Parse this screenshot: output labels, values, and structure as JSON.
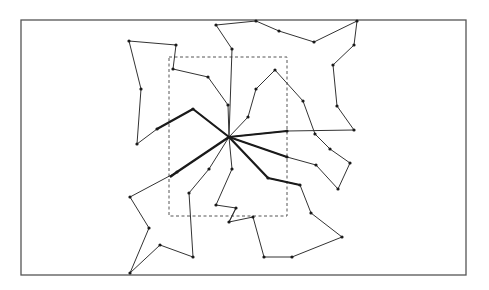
{
  "figure": {
    "type": "star-partition-routing-diagram",
    "colors": {
      "stroke": "#333333",
      "frame": "#555555",
      "dashed": "#555555",
      "node": "#1a1a1a",
      "background": "#ffffff"
    },
    "frame": {
      "x": 21,
      "y": 20,
      "width": 445,
      "height": 255
    },
    "dashed_region": {
      "x": 169,
      "y": 57,
      "width": 118,
      "height": 159
    },
    "hub": {
      "x": 229,
      "y": 137
    },
    "bold_edges": [
      [
        [
          229,
          137
        ],
        [
          193,
          109
        ],
        [
          157,
          129
        ]
      ],
      [
        [
          229,
          137
        ],
        [
          287,
          131
        ]
      ],
      [
        [
          229,
          137
        ],
        [
          287,
          157
        ]
      ],
      [
        [
          229,
          137
        ],
        [
          268,
          178
        ],
        [
          300,
          185
        ]
      ],
      [
        [
          229,
          137
        ],
        [
          177,
          172
        ],
        [
          170,
          177
        ]
      ]
    ],
    "routes": [
      {
        "name": "route-upper-left",
        "points": [
          [
            229,
            137
          ],
          [
            193,
            109
          ],
          [
            157,
            129
          ],
          [
            137,
            144
          ],
          [
            141,
            89
          ],
          [
            129,
            41
          ],
          [
            176,
            45
          ],
          [
            173,
            69
          ],
          [
            208,
            77
          ],
          [
            228,
            105
          ],
          [
            229,
            137
          ]
        ]
      },
      {
        "name": "route-top",
        "points": [
          [
            229,
            137
          ],
          [
            232,
            49
          ],
          [
            216,
            25
          ],
          [
            256,
            21
          ],
          [
            279,
            31
          ],
          [
            314,
            42
          ],
          [
            357,
            21
          ],
          [
            354,
            45
          ],
          [
            333,
            65
          ],
          [
            337,
            106
          ],
          [
            354,
            130
          ],
          [
            287,
            131
          ],
          [
            229,
            137
          ]
        ]
      },
      {
        "name": "route-right",
        "points": [
          [
            229,
            137
          ],
          [
            248,
            117
          ],
          [
            256,
            89
          ],
          [
            275,
            70
          ],
          [
            303,
            101
          ],
          [
            315,
            134
          ],
          [
            330,
            149
          ],
          [
            350,
            163
          ],
          [
            338,
            189
          ],
          [
            316,
            165
          ],
          [
            287,
            157
          ],
          [
            229,
            137
          ]
        ]
      },
      {
        "name": "route-lower-right",
        "points": [
          [
            229,
            137
          ],
          [
            268,
            178
          ],
          [
            300,
            185
          ],
          [
            311,
            213
          ],
          [
            342,
            237
          ],
          [
            292,
            257
          ],
          [
            264,
            257
          ],
          [
            253,
            217
          ],
          [
            229,
            222
          ],
          [
            236,
            208
          ]
        ]
      },
      {
        "name": "route-lower-middle",
        "points": [
          [
            229,
            137
          ],
          [
            232,
            169
          ],
          [
            216,
            205
          ],
          [
            236,
            208
          ],
          [
            229,
            222
          ]
        ]
      },
      {
        "name": "route-lower-left",
        "points": [
          [
            229,
            137
          ],
          [
            177,
            172
          ],
          [
            130,
            197
          ],
          [
            149,
            228
          ],
          [
            130,
            273
          ],
          [
            160,
            245
          ],
          [
            193,
            257
          ],
          [
            189,
            193
          ],
          [
            209,
            169
          ],
          [
            229,
            137
          ]
        ]
      }
    ]
  }
}
